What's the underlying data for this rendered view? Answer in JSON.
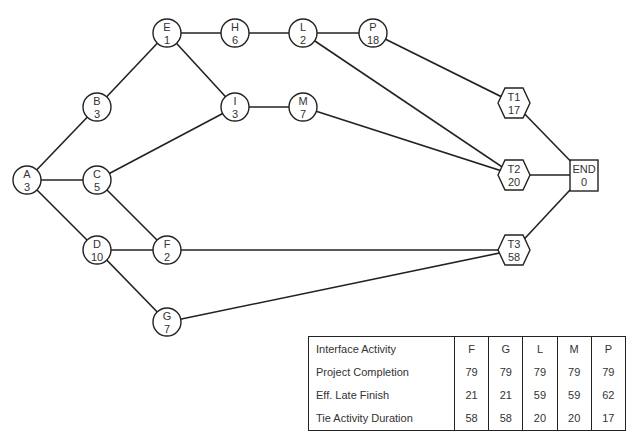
{
  "diagram": {
    "type": "activity-network",
    "nodes": [
      {
        "id": "A",
        "label": "A",
        "value": "3",
        "shape": "circle",
        "x": 27,
        "y": 180
      },
      {
        "id": "B",
        "label": "B",
        "value": "3",
        "shape": "circle",
        "x": 97,
        "y": 107
      },
      {
        "id": "C",
        "label": "C",
        "value": "5",
        "shape": "circle",
        "x": 97,
        "y": 180
      },
      {
        "id": "D",
        "label": "D",
        "value": "10",
        "shape": "circle",
        "x": 97,
        "y": 250
      },
      {
        "id": "E",
        "label": "E",
        "value": "1",
        "shape": "circle",
        "x": 167,
        "y": 33
      },
      {
        "id": "F",
        "label": "F",
        "value": "2",
        "shape": "circle",
        "x": 167,
        "y": 250
      },
      {
        "id": "G",
        "label": "G",
        "value": "7",
        "shape": "circle",
        "x": 167,
        "y": 322
      },
      {
        "id": "H",
        "label": "H",
        "value": "6",
        "shape": "circle",
        "x": 235,
        "y": 33
      },
      {
        "id": "I",
        "label": "I",
        "value": "3",
        "shape": "circle",
        "x": 235,
        "y": 107
      },
      {
        "id": "L",
        "label": "L",
        "value": "2",
        "shape": "circle",
        "x": 303,
        "y": 33
      },
      {
        "id": "M",
        "label": "M",
        "value": "7",
        "shape": "circle",
        "x": 303,
        "y": 107
      },
      {
        "id": "P",
        "label": "P",
        "value": "18",
        "shape": "circle",
        "x": 373,
        "y": 33
      },
      {
        "id": "T1",
        "label": "T1",
        "value": "17",
        "shape": "hexagon",
        "x": 514,
        "y": 103
      },
      {
        "id": "T2",
        "label": "T2",
        "value": "20",
        "shape": "hexagon",
        "x": 514,
        "y": 175
      },
      {
        "id": "T3",
        "label": "T3",
        "value": "58",
        "shape": "hexagon",
        "x": 514,
        "y": 250
      },
      {
        "id": "END",
        "label": "END",
        "value": "0",
        "shape": "square",
        "x": 584,
        "y": 175
      }
    ],
    "edges": [
      [
        "A",
        "B"
      ],
      [
        "A",
        "C"
      ],
      [
        "A",
        "D"
      ],
      [
        "B",
        "E"
      ],
      [
        "C",
        "I"
      ],
      [
        "C",
        "F"
      ],
      [
        "D",
        "F"
      ],
      [
        "D",
        "G"
      ],
      [
        "E",
        "H"
      ],
      [
        "E",
        "I"
      ],
      [
        "H",
        "L"
      ],
      [
        "L",
        "P"
      ],
      [
        "L",
        "T2"
      ],
      [
        "I",
        "M"
      ],
      [
        "M",
        "T2"
      ],
      [
        "P",
        "T1"
      ],
      [
        "F",
        "T3"
      ],
      [
        "G",
        "T3"
      ],
      [
        "T1",
        "END"
      ],
      [
        "T2",
        "END"
      ],
      [
        "T3",
        "END"
      ]
    ]
  },
  "table": {
    "headers": [
      "Interface Activity",
      "F",
      "G",
      "L",
      "M",
      "P"
    ],
    "rows": [
      {
        "label": "Project Completion",
        "values": [
          "79",
          "79",
          "79",
          "79",
          "79"
        ]
      },
      {
        "label": "Eff. Late Finish",
        "values": [
          "21",
          "21",
          "59",
          "59",
          "62"
        ]
      },
      {
        "label": "Tie Activity Duration",
        "values": [
          "58",
          "58",
          "20",
          "20",
          "17"
        ]
      }
    ]
  },
  "caption": {
    "text": ""
  }
}
